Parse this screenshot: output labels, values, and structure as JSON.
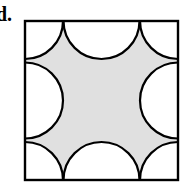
{
  "figure": {
    "label": "d.",
    "caption": "",
    "type": "geometric-shaded-region-diagram",
    "colors": {
      "shaded_fill": "#e0e0e0",
      "unshaded_fill": "#ffffff",
      "stroke": "#000000",
      "background": "#ffffff"
    },
    "geometry": {
      "square": {
        "x": 25,
        "y": 21,
        "width": 153,
        "height": 159,
        "stroke_width": 2
      },
      "corner_arc_radius": 38,
      "edge_semicircle_radius": 38,
      "corner_arcs": [
        {
          "name": "top-left",
          "cx": 25,
          "cy": 21
        },
        {
          "name": "top-right",
          "cx": 178,
          "cy": 21
        },
        {
          "name": "bottom-right",
          "cx": 178,
          "cy": 180
        },
        {
          "name": "bottom-left",
          "cx": 25,
          "cy": 180
        }
      ],
      "edge_semicircles": [
        {
          "name": "top-middle",
          "cx": 101,
          "cy": 21
        },
        {
          "name": "right-middle",
          "cx": 178,
          "cy": 100
        },
        {
          "name": "bottom-middle",
          "cx": 101,
          "cy": 180
        },
        {
          "name": "left-middle",
          "cx": 25,
          "cy": 100
        }
      ]
    }
  }
}
